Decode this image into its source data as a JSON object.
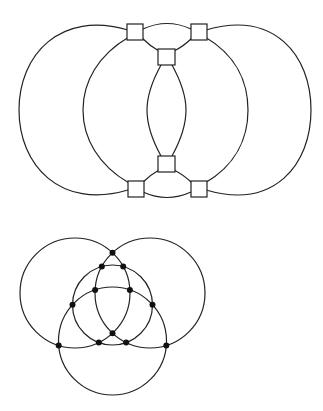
{
  "figure": {
    "type": "graph-drawings",
    "stroke_color": "#222222",
    "node_color": "#111111",
    "background": "#ffffff"
  },
  "top_graph": {
    "name": "curved-graph-with-square-vertices",
    "vertex_shape": "square",
    "vertices": [
      "top-left",
      "top-center",
      "top-right",
      "bottom-left",
      "bottom-center",
      "bottom-right"
    ],
    "edges": [
      [
        "top-left",
        "bottom-left",
        "outer-left-arc"
      ],
      [
        "top-left",
        "bottom-left",
        "inner-left-arc"
      ],
      [
        "top-right",
        "bottom-right",
        "outer-right-arc"
      ],
      [
        "top-right",
        "bottom-right",
        "inner-right-arc"
      ],
      [
        "top-left",
        "top-right",
        "top-arc"
      ],
      [
        "bottom-left",
        "bottom-right",
        "bottom-arc"
      ],
      [
        "top-left",
        "top-center",
        "short-arc"
      ],
      [
        "top-right",
        "top-center",
        "short-arc"
      ],
      [
        "bottom-left",
        "bottom-center",
        "short-arc"
      ],
      [
        "bottom-right",
        "bottom-center",
        "short-arc"
      ],
      [
        "top-center",
        "bottom-center",
        "lens-left-arc"
      ],
      [
        "top-center",
        "bottom-center",
        "lens-right-arc"
      ]
    ]
  },
  "bottom_graph": {
    "name": "four-circle-arrangement",
    "vertex_shape": "dot",
    "circles": [
      "top-left",
      "top-right",
      "bottom",
      "inner"
    ],
    "vertex_count": 12
  }
}
